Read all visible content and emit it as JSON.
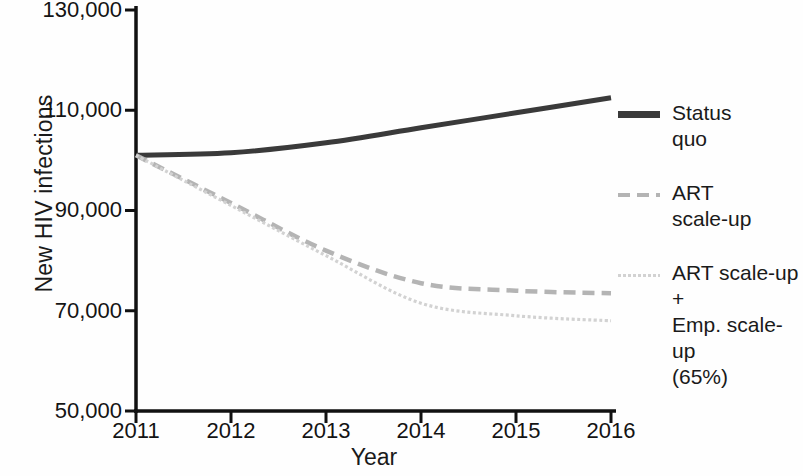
{
  "chart_data": {
    "type": "line",
    "title": "",
    "xlabel": "Year",
    "ylabel": "New HIV infections",
    "x": [
      2011,
      2012,
      2013,
      2014,
      2015,
      2016
    ],
    "xtick_labels": [
      "2011",
      "2012",
      "2013",
      "2014",
      "2015",
      "2016"
    ],
    "ytick_labels": [
      "50,000",
      "70,000",
      "90,000",
      "110,000",
      "130,000"
    ],
    "ytick_values": [
      50000,
      70000,
      90000,
      110000,
      130000
    ],
    "xlim": [
      2011,
      2016
    ],
    "ylim": [
      50000,
      130000
    ],
    "grid": false,
    "legend_position": "right",
    "series": [
      {
        "name": "Status quo",
        "label_lines": [
          "Status",
          "quo"
        ],
        "style": "solid",
        "color": "#3a3a3a",
        "values": [
          101000,
          101500,
          103500,
          106500,
          109500,
          112500
        ]
      },
      {
        "name": "ART scale-up",
        "label_lines": [
          "ART",
          "scale-up"
        ],
        "style": "dashed",
        "color": "#b4b4b4",
        "values": [
          101000,
          91500,
          82000,
          75500,
          74000,
          73500
        ]
      },
      {
        "name": "ART scale-up + Emp. scale-up (65%)",
        "label_lines": [
          "ART scale-up +",
          "Emp. scale-up",
          "(65%)"
        ],
        "style": "dotted",
        "color": "#d2d2d2",
        "values": [
          101000,
          91000,
          81000,
          71500,
          69000,
          68000
        ]
      }
    ]
  },
  "axes": {
    "ylabel": "New HIV infections",
    "xlabel": "Year",
    "yticks": [
      "130,000",
      "110,000",
      "90,000",
      "70,000",
      "50,000"
    ],
    "xticks": [
      "2011",
      "2012",
      "2013",
      "2014",
      "2015",
      "2016"
    ]
  },
  "legend": {
    "items": [
      {
        "swatch": "solid-line-swatch",
        "lines": [
          "Status",
          "quo"
        ]
      },
      {
        "swatch": "dashed-line-swatch",
        "lines": [
          "ART",
          "scale-up"
        ]
      },
      {
        "swatch": "dotted-line-swatch",
        "lines": [
          "ART scale-up +",
          "Emp. scale-up",
          "(65%)"
        ]
      }
    ]
  }
}
